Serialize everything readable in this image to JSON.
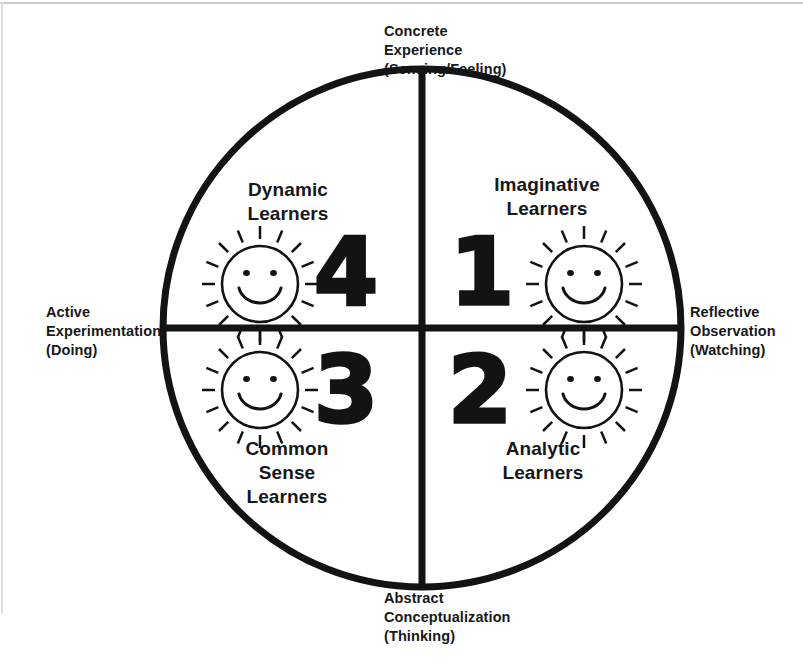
{
  "diagram": {
    "stroke_color": "#111315",
    "text_color": "#16181a",
    "background": "#ffffff",
    "axes": {
      "top": "Concrete\nExperience\n(Sensing/Feeling)",
      "right": "Reflective\nObservation\n(Watching)",
      "bottom": "Abstract\nConceptualization\n(Thinking)",
      "left": "Active\nExperimentation\n(Doing)"
    },
    "quadrants": [
      {
        "id": "quad-1",
        "number": "1",
        "label": "Imaginative\nLearners",
        "position": "top-right",
        "icon": "sun-smiley-icon"
      },
      {
        "id": "quad-2",
        "number": "2",
        "label": "Analytic\nLearners",
        "position": "bottom-right",
        "icon": "sun-smiley-icon"
      },
      {
        "id": "quad-3",
        "number": "3",
        "label": "Common\nSense\nLearners",
        "position": "bottom-left",
        "icon": "sun-smiley-icon"
      },
      {
        "id": "quad-4",
        "number": "4",
        "label": "Dynamic\nLearners",
        "position": "top-left",
        "icon": "sun-smiley-icon"
      }
    ],
    "geometry": {
      "circle_center_x": 422,
      "circle_center_y": 328,
      "circle_radius": 259,
      "circle_stroke_width": 7,
      "divider_stroke_width": 7,
      "sun_ray_count": 16
    }
  }
}
